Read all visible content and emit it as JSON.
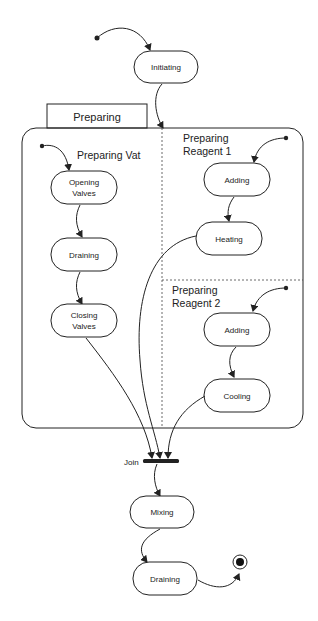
{
  "diagram": {
    "type": "UML state machine",
    "composite_state": {
      "tab_label": "Preparing",
      "regions": [
        {
          "title": "Preparing Vat",
          "states": [
            "Opening Valves",
            "Draining",
            "Closing Valves"
          ]
        },
        {
          "title_line1": "Preparing",
          "title_line2": "Reagent 1",
          "states": [
            "Adding",
            "Heating"
          ]
        },
        {
          "title_line1": "Preparing",
          "title_line2": "Reagent 2",
          "states": [
            "Adding",
            "Cooling"
          ]
        }
      ]
    },
    "states": {
      "initiating": "Initiating",
      "opening_valves_1": "Opening",
      "opening_valves_2": "Valves",
      "vat_draining": "Draining",
      "closing_valves_1": "Closing",
      "closing_valves_2": "Valves",
      "r1_adding": "Adding",
      "r1_heating": "Heating",
      "r2_adding": "Adding",
      "r2_cooling": "Cooling",
      "mixing": "Mixing",
      "final_draining": "Draining"
    },
    "join_label": "Join",
    "region_titles": {
      "vat": "Preparing Vat",
      "r1_line1": "Preparing",
      "r1_line2": "Reagent 1",
      "r2_line1": "Preparing",
      "r2_line2": "Reagent 2"
    },
    "tab_label": "Preparing"
  }
}
